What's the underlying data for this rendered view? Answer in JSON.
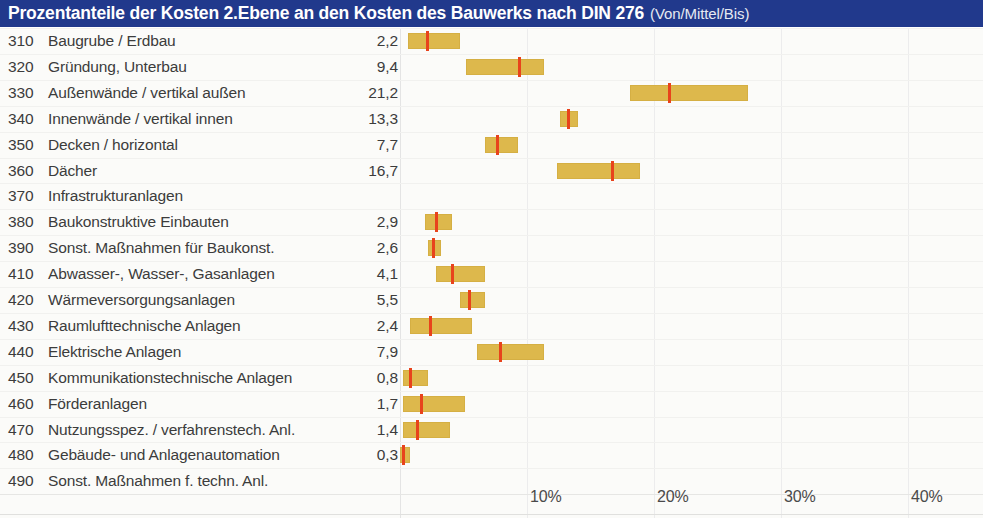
{
  "header": {
    "title_main": "Prozentanteile der Kosten 2.Ebene an den Kosten des Bauwerks nach DIN 276",
    "title_sub": "(Von/Mittel/Bis)",
    "bar_color": "#21398c",
    "text_color": "#ffffff"
  },
  "colors": {
    "band": "#ddb84c",
    "median": "#e8431c",
    "grid": "#ececed",
    "text": "#3c3c3c",
    "background": "#fbfbf9"
  },
  "chart_data": {
    "type": "bar",
    "title": "Prozentanteile der Kosten 2.Ebene an den Kosten des Bauwerks nach DIN 276 (Von/Mittel/Bis)",
    "xlabel": "",
    "ylabel": "",
    "xlim": [
      0,
      44
    ],
    "grid": true,
    "legend": null,
    "xticks": [
      {
        "value": 10,
        "label": "10%"
      },
      {
        "value": 20,
        "label": "20%"
      },
      {
        "value": 30,
        "label": "30%"
      },
      {
        "value": 40,
        "label": "40%"
      }
    ],
    "columns": [
      "Code",
      "Kostengruppe",
      "Mittel",
      "Von",
      "Bis"
    ],
    "rows": [
      {
        "code": "310",
        "label": "Baugrube / Erdbau",
        "value": "2,2",
        "mean": 2.2,
        "low": 0.6,
        "high": 4.7
      },
      {
        "code": "320",
        "label": "Gründung, Unterbau",
        "value": "9,4",
        "mean": 9.4,
        "low": 5.2,
        "high": 11.3
      },
      {
        "code": "330",
        "label": "Außenwände / vertikal außen",
        "value": "21,2",
        "mean": 21.2,
        "low": 18.1,
        "high": 27.4
      },
      {
        "code": "340",
        "label": "Innenwände / vertikal innen",
        "value": "13,3",
        "mean": 13.3,
        "low": 12.6,
        "high": 14.0
      },
      {
        "code": "350",
        "label": "Decken / horizontal",
        "value": "7,7",
        "mean": 7.7,
        "low": 6.7,
        "high": 9.3
      },
      {
        "code": "360",
        "label": "Dächer",
        "value": "16,7",
        "mean": 16.7,
        "low": 12.4,
        "high": 18.9
      },
      {
        "code": "370",
        "label": "Infrastrukturanlagen",
        "value": "",
        "mean": null,
        "low": null,
        "high": null
      },
      {
        "code": "380",
        "label": "Baukonstruktive Einbauten",
        "value": "2,9",
        "mean": 2.9,
        "low": 2.0,
        "high": 4.1
      },
      {
        "code": "390",
        "label": "Sonst. Maßnahmen für Baukonst.",
        "value": "2,6",
        "mean": 2.6,
        "low": 2.2,
        "high": 3.2
      },
      {
        "code": "410",
        "label": "Abwasser-, Wasser-, Gasanlagen",
        "value": "4,1",
        "mean": 4.1,
        "low": 2.8,
        "high": 6.7
      },
      {
        "code": "420",
        "label": "Wärmeversorgungsanlagen",
        "value": "5,5",
        "mean": 5.5,
        "low": 4.7,
        "high": 6.7
      },
      {
        "code": "430",
        "label": "Raumlufttechnische Anlagen",
        "value": "2,4",
        "mean": 2.4,
        "low": 0.8,
        "high": 5.7
      },
      {
        "code": "440",
        "label": "Elektrische Anlagen",
        "value": "7,9",
        "mean": 7.9,
        "low": 6.1,
        "high": 11.3
      },
      {
        "code": "450",
        "label": "Kommunikationstechnische Anlagen",
        "value": "0,8",
        "mean": 0.8,
        "low": 0.2,
        "high": 2.2
      },
      {
        "code": "460",
        "label": "Förderanlagen",
        "value": "1,7",
        "mean": 1.7,
        "low": 0.2,
        "high": 5.1
      },
      {
        "code": "470",
        "label": "Nutzungsspez. / verfahrenstech. Anl.",
        "value": "1,4",
        "mean": 1.4,
        "low": 0.2,
        "high": 3.9
      },
      {
        "code": "480",
        "label": "Gebäude- und Anlagenautomation",
        "value": "0,3",
        "mean": 0.3,
        "low": 0.0,
        "high": 0.8
      },
      {
        "code": "490",
        "label": "Sonst. Maßnahmen f. techn. Anl.",
        "value": "",
        "mean": null,
        "low": null,
        "high": null
      }
    ]
  }
}
